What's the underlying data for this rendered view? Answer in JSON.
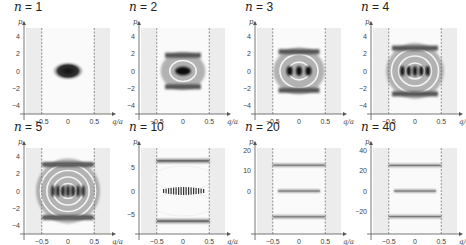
{
  "figure": {
    "axis_x_label": "q/a",
    "axis_y_label": "p",
    "dashed_lines_at": [
      -0.5,
      0.5
    ],
    "colors": {
      "ink": "#111111",
      "shade": "#ececec",
      "axis": "#555555",
      "dash": "#666666"
    }
  },
  "chart_data": [
    {
      "type": "heatmap",
      "title": "n = 1",
      "n": 1,
      "xlabel": "q/a",
      "ylabel": "p",
      "xticks": [
        "-0.5",
        "0",
        "0.5"
      ],
      "yticks": [
        "4",
        "2",
        "0",
        "-2",
        "-4"
      ],
      "ylim": [
        -5,
        5
      ],
      "xlim": [
        -0.8,
        0.8
      ],
      "pattern": "single dark blob at origin"
    },
    {
      "type": "heatmap",
      "title": "n = 2",
      "n": 2,
      "xlabel": "q/a",
      "ylabel": "p",
      "xticks": [
        "-0.5",
        "0",
        "0.5"
      ],
      "yticks": [
        "4",
        "2",
        "0",
        "-2",
        "-4"
      ],
      "ylim": [
        -5,
        5
      ],
      "xlim": [
        -0.8,
        0.8
      ],
      "pattern": "dark core with light ring, dark surround"
    },
    {
      "type": "heatmap",
      "title": "n = 3",
      "n": 3,
      "xlabel": "q/a",
      "ylabel": "p",
      "xticks": [
        "-0.5",
        "0",
        "0.5"
      ],
      "yticks": [
        "4",
        "2",
        "0",
        "-2",
        "-4"
      ],
      "ylim": [
        -5,
        5
      ],
      "xlim": [
        -0.8,
        0.8
      ],
      "pattern": "3 central dark spots with rings, bands at p≈±2"
    },
    {
      "type": "heatmap",
      "title": "n = 4",
      "n": 4,
      "xlabel": "q/a",
      "ylabel": "p",
      "xticks": [
        "-0.5",
        "0",
        "0.5"
      ],
      "yticks": [
        "4",
        "2",
        "0",
        "-2",
        "-4"
      ],
      "ylim": [
        -5,
        5
      ],
      "xlim": [
        -0.8,
        0.8
      ],
      "pattern": "5 central fringes, bands at p≈±2.5"
    },
    {
      "type": "heatmap",
      "title": "n = 5",
      "n": 5,
      "xlabel": "q/a",
      "ylabel": "p",
      "xticks": [
        "-0.5",
        "0",
        "0.5"
      ],
      "yticks": [
        "4",
        "2",
        "0",
        "-2",
        "-4"
      ],
      "ylim": [
        -5,
        5
      ],
      "xlim": [
        -0.8,
        0.8
      ],
      "pattern": "central fringes, lines at p≈±3.1"
    },
    {
      "type": "heatmap",
      "title": "n = 10",
      "n": 10,
      "xlabel": "q/a",
      "ylabel": "p",
      "xticks": [
        "-0.5",
        "0",
        "0.5"
      ],
      "yticks": [
        "5",
        "0",
        "-5"
      ],
      "ylim": [
        -9,
        9
      ],
      "xlim": [
        -0.8,
        0.8
      ],
      "pattern": "fine central fringes, lines at p≈±6.3"
    },
    {
      "type": "heatmap",
      "title": "n = 20",
      "n": 20,
      "xlabel": "q/a",
      "ylabel": "p",
      "xticks": [
        "-0.5",
        "0",
        "0.5"
      ],
      "yticks": [
        "20",
        "10",
        "0"
      ],
      "ylim": [
        -21,
        21
      ],
      "xlim": [
        -0.8,
        0.8
      ],
      "pattern": "three thin horizontal lines at p≈0, ±12.6"
    },
    {
      "type": "heatmap",
      "title": "n = 40",
      "n": 40,
      "xlabel": "q/a",
      "ylabel": "p",
      "xticks": [
        "-0.5",
        "0",
        "0.5"
      ],
      "yticks": [
        "40",
        "20",
        "0",
        "-20"
      ],
      "ylim": [
        -42,
        42
      ],
      "xlim": [
        -0.8,
        0.8
      ],
      "pattern": "three thin horizontal lines at p≈0, ±25"
    }
  ],
  "panels": [
    {
      "n_label": "n",
      "eq": " = ",
      "n_value": "1",
      "x": 0,
      "y": 0
    },
    {
      "n_label": "n",
      "eq": " = ",
      "n_value": "2",
      "x": 115,
      "y": 0
    },
    {
      "n_label": "n",
      "eq": " = ",
      "n_value": "3",
      "x": 231,
      "y": 0
    },
    {
      "n_label": "n",
      "eq": " = ",
      "n_value": "4",
      "x": 347,
      "y": 0
    },
    {
      "n_label": "n",
      "eq": " = ",
      "n_value": "5",
      "x": 0,
      "y": 120
    },
    {
      "n_label": "n",
      "eq": " = ",
      "n_value": "10",
      "x": 115,
      "y": 120
    },
    {
      "n_label": "n",
      "eq": " = ",
      "n_value": "20",
      "x": 231,
      "y": 120
    },
    {
      "n_label": "n",
      "eq": " = ",
      "n_value": "40",
      "x": 347,
      "y": 120
    }
  ]
}
